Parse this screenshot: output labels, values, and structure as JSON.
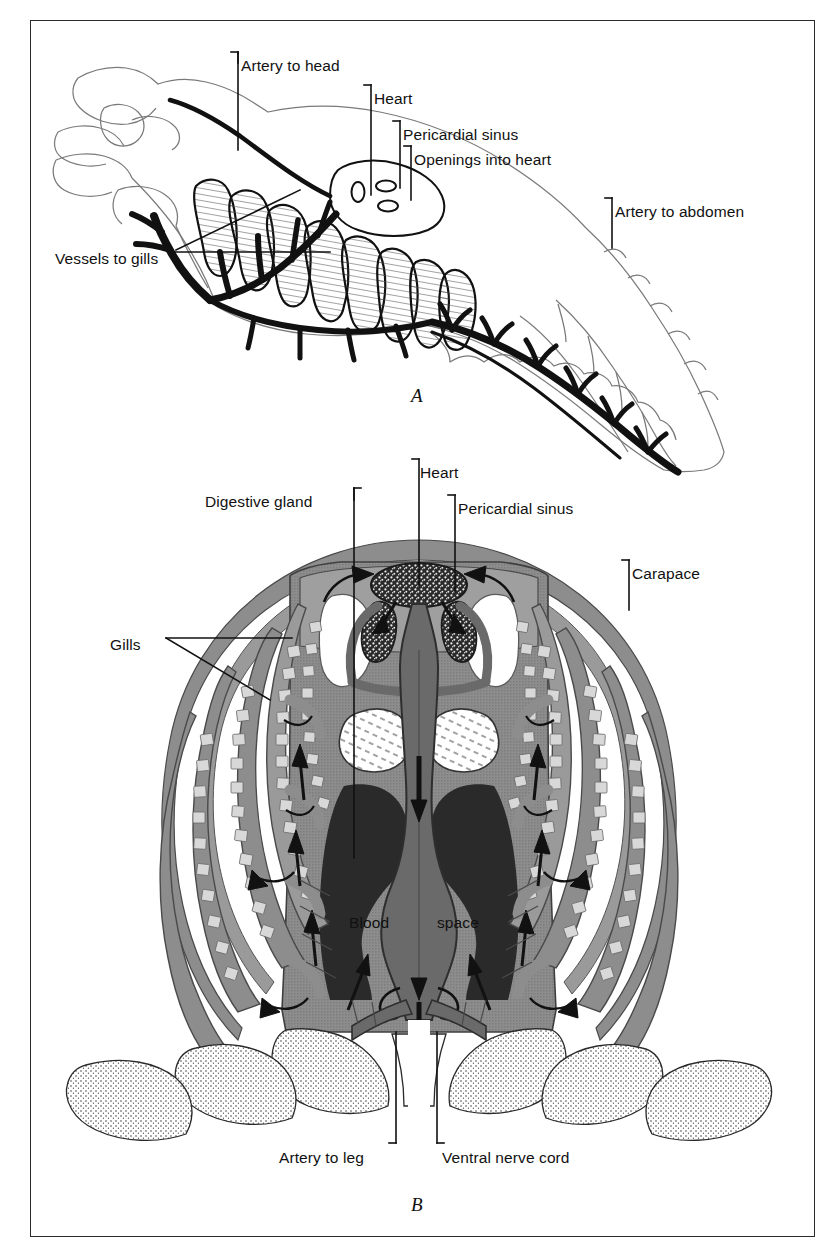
{
  "figure": {
    "kind": "anatomical-diagram",
    "background_color": "#ffffff",
    "ink_color": "#111111",
    "frame_color": "#2b2b2b"
  },
  "panels": [
    {
      "id": "A",
      "letter": "A",
      "view": "lateral (sagittal) view of cephalothorax and abdomen",
      "labels": [
        {
          "id": "artery-to-head",
          "text": "Artery to head",
          "x": 241,
          "y": 58,
          "leader": "elbow-left-down"
        },
        {
          "id": "heart",
          "text": "Heart",
          "x": 374,
          "y": 91,
          "leader": "elbow-left-down"
        },
        {
          "id": "pericardial-sinus",
          "text": "Pericardial sinus",
          "x": 403,
          "y": 127,
          "leader": "elbow-left-down"
        },
        {
          "id": "openings-into-heart",
          "text": "Openings into heart",
          "x": 414,
          "y": 152,
          "leader": "elbow-left-down"
        },
        {
          "id": "artery-to-abdomen",
          "text": "Artery to abdomen",
          "x": 615,
          "y": 204,
          "leader": "elbow-left-down"
        },
        {
          "id": "vessels-to-gills",
          "text": "Vessels to gills",
          "x": 55,
          "y": 251,
          "leader": "fork-right"
        }
      ]
    },
    {
      "id": "B",
      "letter": "B",
      "view": "transverse cross-section through the thorax",
      "labels": [
        {
          "id": "digestive-gland",
          "text": "Digestive gland",
          "x": 205,
          "y": 494,
          "leader": "elbow-right-down"
        },
        {
          "id": "heart",
          "text": "Heart",
          "x": 420,
          "y": 465,
          "leader": "elbow-left-down"
        },
        {
          "id": "pericardial-sinus",
          "text": "Pericardial sinus",
          "x": 458,
          "y": 501,
          "leader": "elbow-left-down"
        },
        {
          "id": "carapace",
          "text": "Carapace",
          "x": 632,
          "y": 566,
          "leader": "elbow-left-down"
        },
        {
          "id": "gills",
          "text": "Gills",
          "x": 110,
          "y": 637,
          "leader": "fork-right"
        },
        {
          "id": "blood-space",
          "text": "Blood",
          "x": 349,
          "y": 915,
          "leader": "none"
        },
        {
          "id": "blood-space-2",
          "text": "space",
          "x": 437,
          "y": 915,
          "leader": "none"
        },
        {
          "id": "artery-to-leg",
          "text": "Artery to leg",
          "x": 279,
          "y": 1150,
          "leader": "elbow-right-up"
        },
        {
          "id": "ventral-nerve-cord",
          "text": "Ventral nerve cord",
          "x": 442,
          "y": 1150,
          "leader": "elbow-left-up"
        }
      ]
    }
  ],
  "palette": {
    "tissue_gray": "#8d8d8d",
    "tissue_gray_light": "#a9a9a9",
    "vessel_dark": "#6a6a6a",
    "organ_black": "#2a2a2a",
    "outline": "#111111",
    "white": "#ffffff",
    "stipple": "#3a3a3a"
  }
}
